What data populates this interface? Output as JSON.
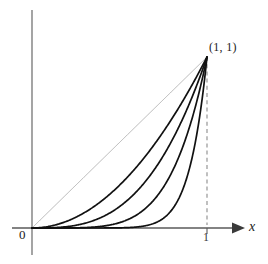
{
  "figure": {
    "background_color": "#ffffff",
    "axis_color": "#555555",
    "curve_color": "#111111",
    "diagonal_color": "#9a9a9a",
    "dashed_color": "#8c8c8c"
  },
  "labels": {
    "origin": "0",
    "x_tick_one": "1",
    "x_axis": "x",
    "point": "(1, 1)"
  },
  "chart_data": {
    "type": "line",
    "title": "",
    "subtitle": "",
    "xlabel": "x",
    "ylabel": "",
    "xlim": [
      0,
      1
    ],
    "ylim": [
      0,
      1
    ],
    "grid": false,
    "legend": "none",
    "xticks": [
      0,
      1
    ],
    "xticklabels": [
      "0",
      "1"
    ],
    "yticks": [],
    "yticklabels": [],
    "annotations": [
      {
        "text": "(1, 1)",
        "x": 1,
        "y": 1,
        "position": "upper-right-of-point"
      }
    ],
    "x": [
      0,
      0.05,
      0.1,
      0.15,
      0.2,
      0.25,
      0.3,
      0.35,
      0.4,
      0.45,
      0.5,
      0.55,
      0.6,
      0.65,
      0.7,
      0.75,
      0.8,
      0.85,
      0.9,
      0.95,
      1
    ],
    "series": [
      {
        "name": "y = x",
        "exponent": 1,
        "style": "solid-light",
        "color": "#9a9a9a",
        "width": 0.7,
        "values": [
          0,
          0.05,
          0.1,
          0.15,
          0.2,
          0.25,
          0.3,
          0.35,
          0.4,
          0.45,
          0.5,
          0.55,
          0.6,
          0.65,
          0.7,
          0.75,
          0.8,
          0.85,
          0.9,
          0.95,
          1
        ]
      },
      {
        "name": "y = x^2",
        "exponent": 2,
        "style": "solid",
        "color": "#111111",
        "width": 1.7,
        "values": [
          0,
          0.0025,
          0.01,
          0.0225,
          0.04,
          0.0625,
          0.09,
          0.1225,
          0.16,
          0.2025,
          0.25,
          0.3025,
          0.36,
          0.4225,
          0.49,
          0.5625,
          0.64,
          0.7225,
          0.81,
          0.9025,
          1
        ]
      },
      {
        "name": "y = x^3",
        "exponent": 3,
        "style": "solid",
        "color": "#111111",
        "width": 1.7,
        "values": [
          0,
          0.000125,
          0.001,
          0.003375,
          0.008,
          0.015625,
          0.027,
          0.042875,
          0.064,
          0.091125,
          0.125,
          0.166375,
          0.216,
          0.274625,
          0.343,
          0.421875,
          0.512,
          0.614125,
          0.729,
          0.857375,
          1
        ]
      },
      {
        "name": "y = x^5",
        "exponent": 5,
        "style": "solid",
        "color": "#111111",
        "width": 1.7,
        "values": [
          0,
          3e-07,
          1e-05,
          7.59e-05,
          0.00032,
          0.000977,
          0.00243,
          0.00525,
          0.01024,
          0.01845,
          0.03125,
          0.05033,
          0.07776,
          0.11603,
          0.16807,
          0.2373,
          0.32768,
          0.44371,
          0.59049,
          0.77378,
          1
        ]
      },
      {
        "name": "y = x^10",
        "exponent": 10,
        "style": "solid",
        "color": "#111111",
        "width": 1.7,
        "values": [
          0,
          0,
          0,
          0,
          0,
          9.5e-07,
          5.9e-06,
          2.76e-05,
          0.000105,
          0.00034,
          0.000977,
          0.00253,
          0.00605,
          0.01346,
          0.02825,
          0.05631,
          0.10737,
          0.19687,
          0.34868,
          0.59874,
          1
        ]
      }
    ],
    "reference_lines": [
      {
        "name": "vertical-dashed-at-x-1",
        "orientation": "vertical",
        "x": 1,
        "from_y": 0,
        "to_y": 1,
        "dash": true
      }
    ]
  },
  "geometry": {
    "origin_px": {
      "x": 32,
      "y": 228
    },
    "unit_px": {
      "x": 207,
      "y": 57
    },
    "x_axis_start_px": 12,
    "x_axis_end_px": 243,
    "y_axis_top_px": 10,
    "y_axis_bottom_px": 255
  }
}
